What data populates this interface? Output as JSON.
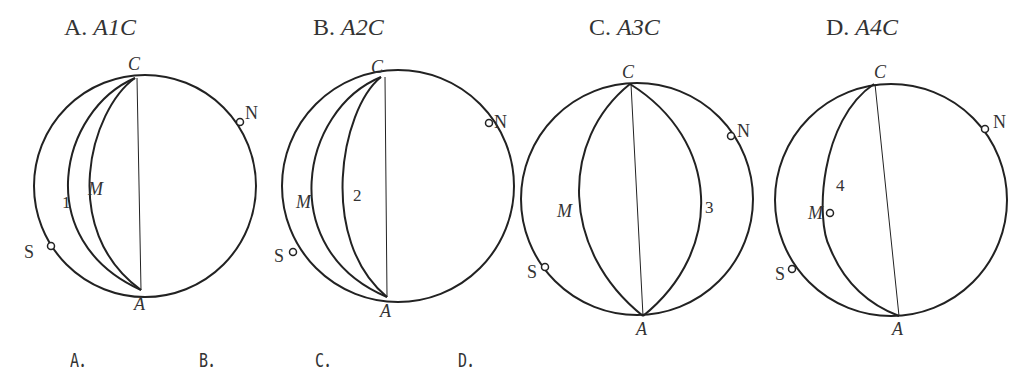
{
  "header_cutoff_text": "……（只画出了部分，其余为空白）",
  "options": [
    {
      "letter": "A.",
      "path_label": "A1C",
      "caption": "A．",
      "arc_label": "1",
      "point_m": "M",
      "point_c": "C",
      "point_a": "A",
      "point_n": "N",
      "point_s": "S"
    },
    {
      "letter": "B.",
      "path_label": "A2C",
      "caption": "B．",
      "arc_label": "2",
      "point_m": "M",
      "point_c": "C",
      "point_a": "A",
      "point_n": "N",
      "point_s": "S"
    },
    {
      "letter": "C.",
      "path_label": "A3C",
      "caption": "C．",
      "arc_label": "3",
      "point_m": "M",
      "point_c": "C",
      "point_a": "A",
      "point_n": "N",
      "point_s": "S"
    },
    {
      "letter": "D.",
      "path_label": "A4C",
      "caption": "D．",
      "arc_label": "4",
      "point_m": "M",
      "point_c": "C",
      "point_a": "A",
      "point_n": "N",
      "point_s": "S"
    }
  ],
  "figure_caption": "第  题图",
  "colors": {
    "stroke": "#222222",
    "text": "#333333",
    "background": "#ffffff"
  }
}
